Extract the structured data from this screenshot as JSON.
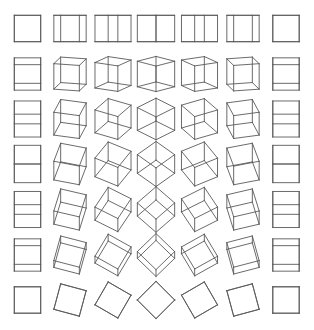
{
  "figure": {
    "width": 314,
    "height": 330,
    "background": "#ffffff",
    "stroke_color": "#5a5a5a",
    "stroke_width": 0.9,
    "cube_half_size": 13.2
  },
  "grid": {
    "rows": 7,
    "cols": 7,
    "row_angles_deg": [
      0,
      15,
      30,
      45,
      60,
      75,
      90
    ],
    "col_angles_deg": [
      0,
      15,
      30,
      45,
      60,
      75,
      90
    ],
    "row_centers_y": [
      28.5,
      74,
      119,
      164,
      209.5,
      255,
      300
    ],
    "col_centers_x": [
      27.5,
      70,
      113,
      156,
      199.5,
      243,
      286
    ],
    "row_axis": "x",
    "col_axis": "y"
  }
}
